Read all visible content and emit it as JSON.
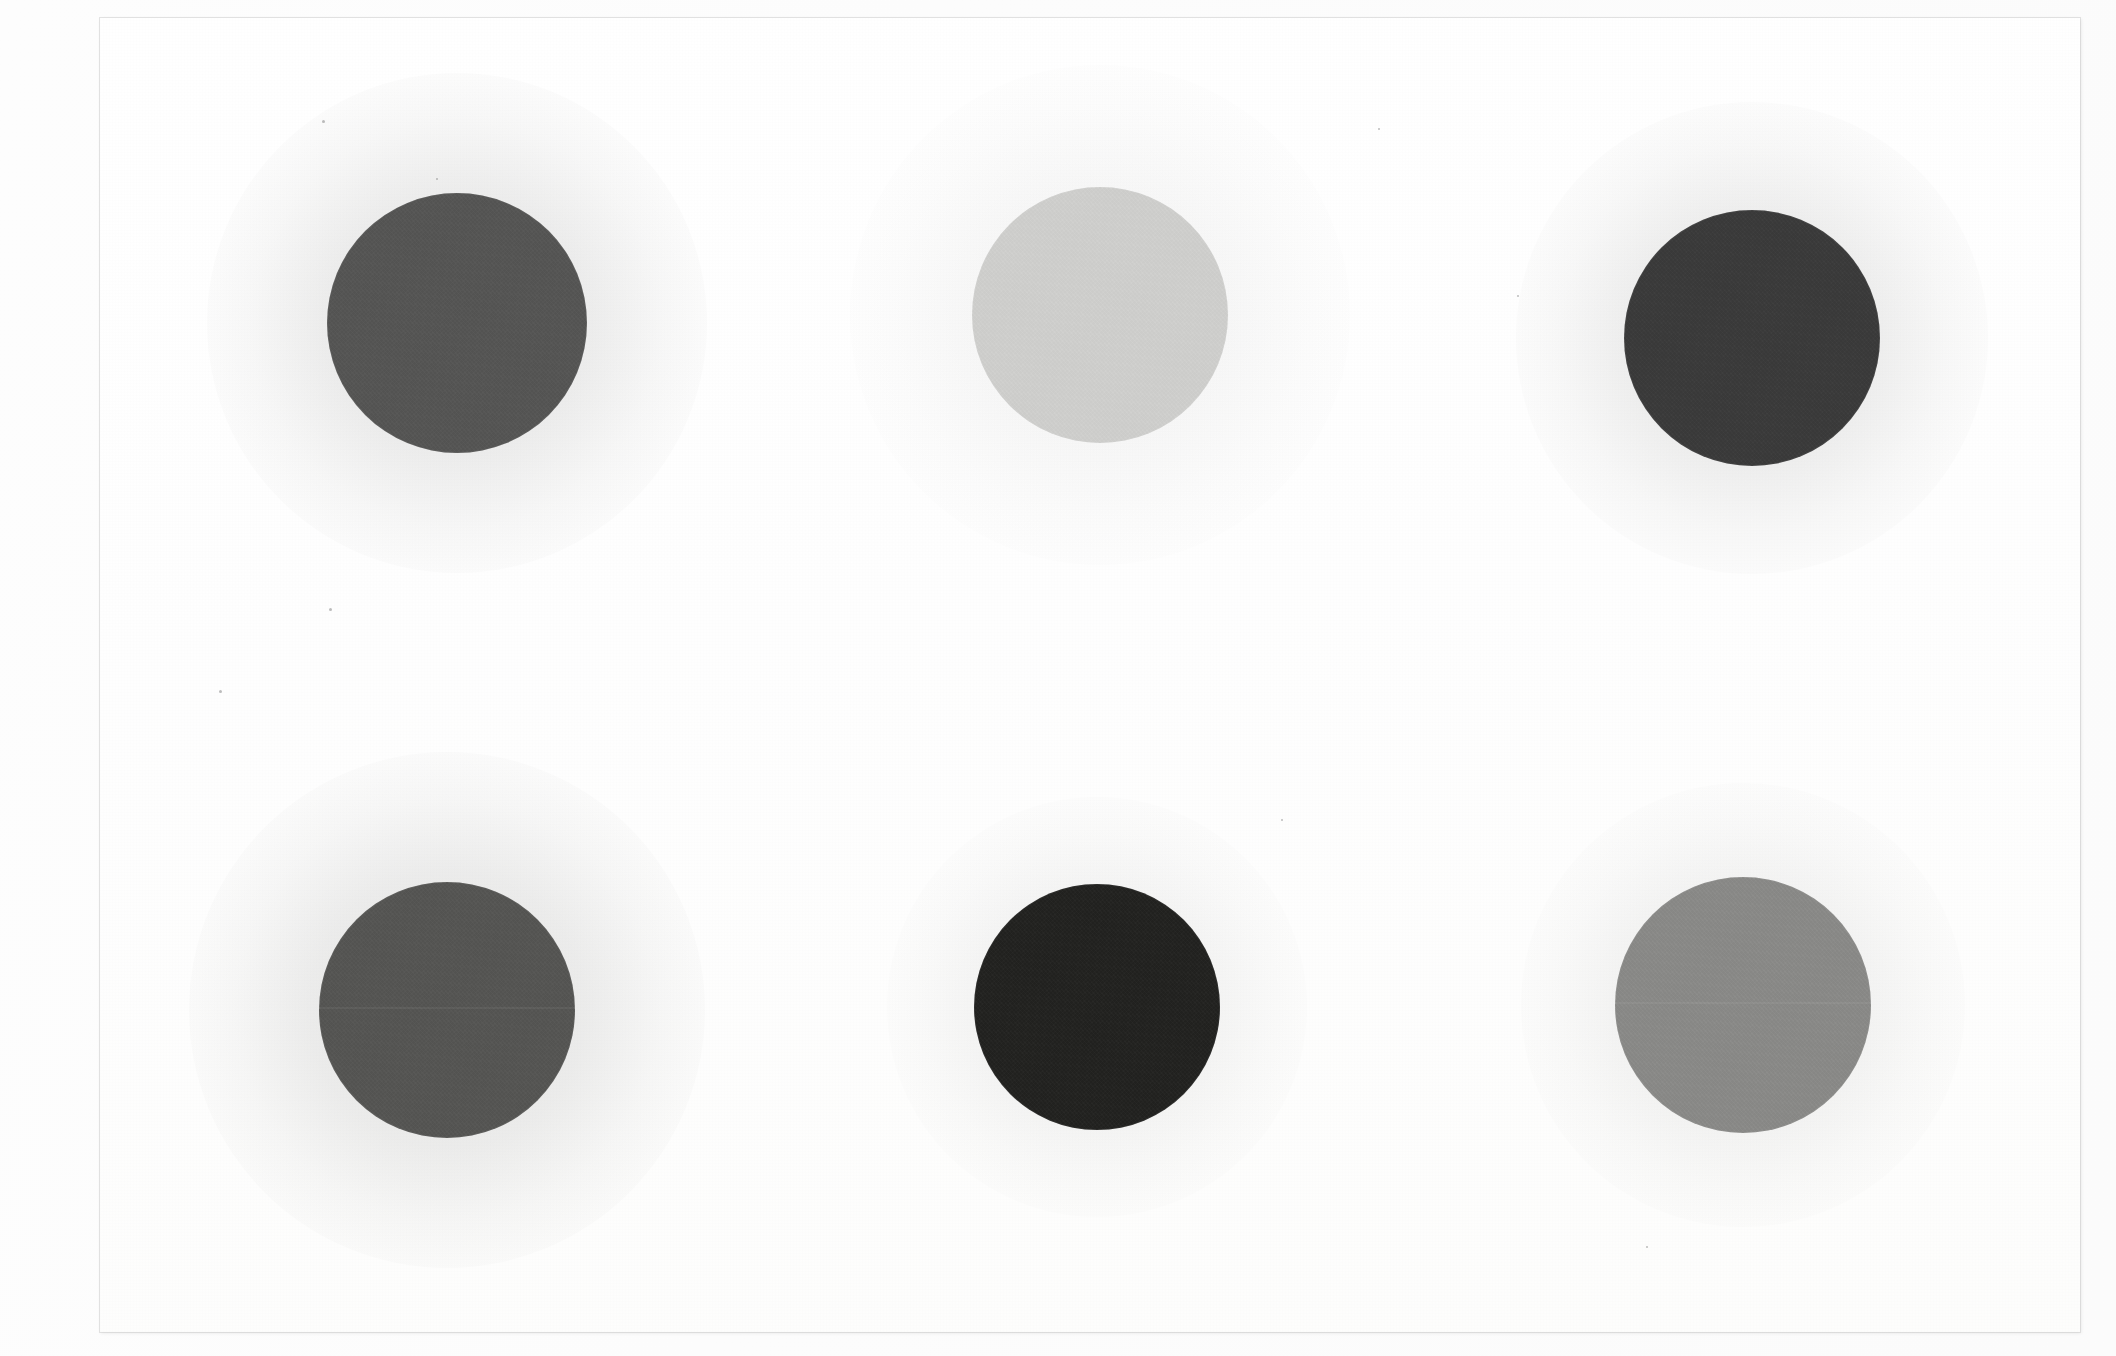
{
  "scan": {
    "title": "Gray Disc Array Scan",
    "surface_color": "#fdfdfd",
    "paper_color": "#ffffff",
    "paper_edge_color": "#cdcdcd",
    "width_px": 2116,
    "height_px": 1356,
    "paper": {
      "left": 100,
      "top": 18,
      "width": 1980,
      "height": 1314
    },
    "layout": {
      "rows": 2,
      "columns": 3,
      "total_discs": 6
    }
  },
  "discs": [
    {
      "id": "disc-1",
      "label": "Disc 1",
      "row": 1,
      "column": 1,
      "position_label": "top-left",
      "cx": 457,
      "cy": 323,
      "radius": 130,
      "color": "#555554",
      "tone_name": "medium-dark gray",
      "gray_value": 85,
      "halo_radius": 250,
      "halo_strength": 0.22,
      "has_seam": false
    },
    {
      "id": "disc-2",
      "label": "Disc 2",
      "row": 1,
      "column": 2,
      "position_label": "top-center",
      "cx": 1100,
      "cy": 315,
      "radius": 128,
      "color": "#d0d0ce",
      "tone_name": "very light gray",
      "gray_value": 208,
      "halo_radius": 250,
      "halo_strength": 0.09,
      "has_seam": false
    },
    {
      "id": "disc-3",
      "label": "Disc 3",
      "row": 1,
      "column": 3,
      "position_label": "top-right",
      "cx": 1752,
      "cy": 338,
      "radius": 128,
      "color": "#3a3a3a",
      "tone_name": "dark gray",
      "gray_value": 58,
      "halo_radius": 236,
      "halo_strength": 0.2,
      "has_seam": false
    },
    {
      "id": "disc-4",
      "label": "Disc 4",
      "row": 2,
      "column": 1,
      "position_label": "bottom-left",
      "cx": 447,
      "cy": 1010,
      "radius": 128,
      "color": "#555553",
      "tone_name": "medium-dark gray",
      "gray_value": 85,
      "halo_radius": 258,
      "halo_strength": 0.22,
      "has_seam": true
    },
    {
      "id": "disc-5",
      "label": "Disc 5",
      "row": 2,
      "column": 2,
      "position_label": "bottom-center",
      "cx": 1097,
      "cy": 1007,
      "radius": 123,
      "color": "#222220",
      "tone_name": "near black",
      "gray_value": 34,
      "halo_radius": 210,
      "halo_strength": 0.13,
      "has_seam": false
    },
    {
      "id": "disc-6",
      "label": "Disc 6",
      "row": 2,
      "column": 3,
      "position_label": "bottom-right",
      "cx": 1743,
      "cy": 1005,
      "radius": 128,
      "color": "#8a8a88",
      "tone_name": "medium gray",
      "gray_value": 138,
      "halo_radius": 222,
      "halo_strength": 0.14,
      "has_seam": true
    }
  ],
  "specks": [
    {
      "x": 322,
      "y": 120,
      "size": 3
    },
    {
      "x": 436,
      "y": 178,
      "size": 2
    },
    {
      "x": 329,
      "y": 608,
      "size": 3
    },
    {
      "x": 219,
      "y": 690,
      "size": 3
    },
    {
      "x": 1378,
      "y": 128,
      "size": 2
    },
    {
      "x": 1517,
      "y": 295,
      "size": 2
    },
    {
      "x": 1281,
      "y": 819,
      "size": 2
    },
    {
      "x": 1646,
      "y": 1246,
      "size": 2
    }
  ]
}
